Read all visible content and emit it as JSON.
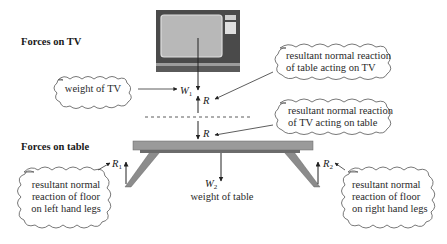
{
  "headings": {
    "tv": "Forces on TV",
    "table": "Forces on table"
  },
  "labels": {
    "w1": "W",
    "w1_sub": "1",
    "r_on_tv": "R",
    "r_on_table": "R",
    "r1": "R",
    "r1_sub": "1",
    "r2": "R",
    "r2_sub": "2",
    "w2": "W",
    "w2_sub": "2"
  },
  "annotations": {
    "weight_of_tv": "weight of TV",
    "table_on_tv": [
      "resultant normal reaction",
      "of table acting on TV"
    ],
    "tv_on_table": [
      "resultant normal reaction",
      "of TV acting  on table"
    ],
    "weight_of_table": "weight of table",
    "floor_left": [
      "resultant normal",
      "reaction of floor",
      "on left hand legs"
    ],
    "floor_right": [
      "resultant normal",
      "reaction of floor",
      "on right hand legs"
    ]
  },
  "colors": {
    "tv_body": "#4a4a4a",
    "tv_screen": "#b8b8b8",
    "tv_screen_border": "#dddddd",
    "tv_stand": "#6a6a6a",
    "table_top": "#9a9a9a",
    "table_underside": "#6c6c6c",
    "table_leg": "#8c8c8c"
  }
}
